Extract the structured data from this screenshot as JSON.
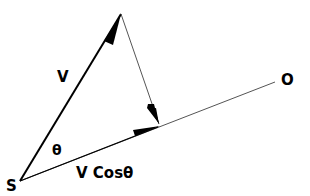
{
  "diagram": {
    "type": "vector-resolution",
    "labels": {
      "source": "S",
      "observer": "O",
      "velocity": "V",
      "angle": "θ",
      "component": "V Cosθ"
    },
    "colors": {
      "stroke": "#000000",
      "thin_stroke": "#555555",
      "background": "#ffffff"
    }
  }
}
